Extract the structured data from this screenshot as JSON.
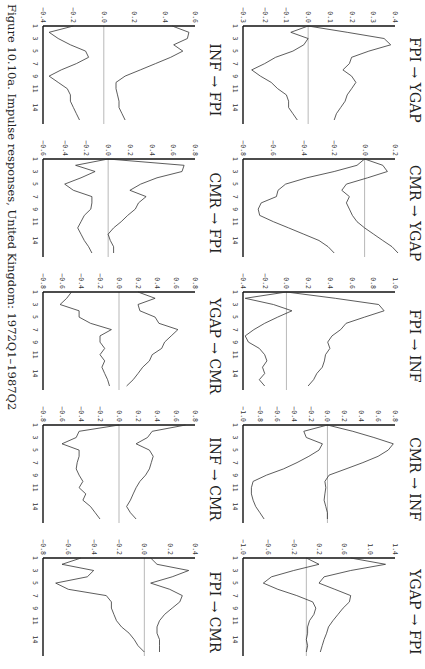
{
  "caption": "Figure 10.10a. Impulse responses, United Kingdom: 1972Q1–1987Q2",
  "chart_data": [
    {
      "type": "line",
      "title": "FPI → YGAP",
      "ylim": [
        -0.3,
        0.4
      ],
      "yticks": [
        0.4,
        0.3,
        0.2,
        0.1,
        0.0,
        -0.1,
        -0.2,
        -0.3
      ],
      "xticks": [
        1,
        3,
        5,
        7,
        9,
        11,
        14
      ],
      "x": [
        1,
        2,
        3,
        4,
        5,
        6,
        7,
        8,
        9,
        10,
        11,
        12,
        13,
        14,
        15,
        16
      ],
      "series": [
        {
          "name": "upper",
          "values": [
            0.0,
            0.18,
            0.35,
            0.38,
            0.28,
            0.2,
            0.19,
            0.16,
            0.2,
            0.22,
            0.2,
            0.18,
            0.17,
            0.15,
            0.13,
            0.12
          ]
        },
        {
          "name": "lower",
          "values": [
            0.0,
            -0.08,
            0.0,
            -0.02,
            -0.07,
            -0.15,
            -0.2,
            -0.26,
            -0.22,
            -0.17,
            -0.14,
            -0.1,
            -0.09,
            -0.09,
            -0.07,
            -0.05
          ]
        }
      ]
    },
    {
      "type": "line",
      "title": "CMR → YGAP",
      "ylim": [
        -0.8,
        0.2
      ],
      "yticks": [
        0.2,
        0.0,
        -0.2,
        -0.4,
        -0.6,
        -0.8
      ],
      "xticks": [
        1,
        3,
        5,
        7,
        9,
        11,
        14
      ],
      "x": [
        1,
        2,
        3,
        4,
        5,
        6,
        7,
        8,
        9,
        10,
        11,
        12,
        13,
        14,
        15,
        16
      ],
      "series": [
        {
          "name": "upper",
          "values": [
            0.0,
            0.12,
            0.15,
            0.02,
            -0.12,
            -0.15,
            -0.1,
            -0.12,
            -0.1,
            -0.08,
            -0.05,
            0.0,
            0.06,
            0.12,
            0.18,
            0.22
          ]
        },
        {
          "name": "lower",
          "values": [
            0.0,
            -0.05,
            -0.2,
            -0.38,
            -0.52,
            -0.57,
            -0.58,
            -0.68,
            -0.7,
            -0.69,
            -0.6,
            -0.5,
            -0.4,
            -0.3,
            -0.24,
            -0.2
          ]
        }
      ]
    },
    {
      "type": "line",
      "title": "FPI → INF",
      "ylim": [
        -0.4,
        1.0
      ],
      "yticks": [
        1.0,
        0.8,
        0.6,
        0.4,
        0.2,
        0.0,
        -0.2,
        -0.4
      ],
      "xticks": [
        1,
        3,
        5,
        7,
        9,
        11,
        14
      ],
      "x": [
        1,
        2,
        3,
        4,
        5,
        6,
        7,
        8,
        9,
        10,
        11,
        12,
        13,
        14,
        15,
        16
      ],
      "series": [
        {
          "name": "upper",
          "values": [
            0.0,
            0.45,
            0.85,
            0.9,
            0.72,
            0.55,
            0.5,
            0.42,
            0.38,
            0.4,
            0.36,
            0.35,
            0.33,
            0.28,
            0.25,
            0.2
          ]
        },
        {
          "name": "lower",
          "values": [
            0.0,
            -0.38,
            -0.12,
            0.05,
            -0.08,
            -0.2,
            -0.3,
            -0.38,
            -0.35,
            -0.25,
            -0.2,
            -0.18,
            -0.22,
            -0.2,
            -0.25,
            -0.2
          ]
        }
      ]
    },
    {
      "type": "line",
      "title": "CMR → INF",
      "ylim": [
        -1.0,
        0.8
      ],
      "yticks": [
        0.8,
        0.6,
        0.4,
        0.2,
        0.0,
        -0.2,
        -0.4,
        -0.6,
        -0.8,
        -1.0
      ],
      "xticks": [
        1,
        3,
        5,
        7,
        9,
        11,
        14
      ],
      "x": [
        1,
        2,
        3,
        4,
        5,
        6,
        7,
        8,
        9,
        10,
        11,
        12,
        13,
        14,
        15,
        16
      ],
      "series": [
        {
          "name": "upper",
          "values": [
            0.0,
            0.3,
            0.55,
            0.78,
            0.72,
            0.6,
            0.42,
            0.22,
            0.02,
            -0.03,
            -0.02,
            -0.03,
            -0.04,
            -0.02,
            0.0,
            0.0
          ]
        },
        {
          "name": "lower",
          "values": [
            0.0,
            -0.28,
            -0.25,
            -0.06,
            -0.1,
            -0.22,
            -0.36,
            -0.52,
            -0.72,
            -0.88,
            -0.9,
            -0.9,
            -0.88,
            -0.85,
            -0.8,
            -0.75
          ]
        }
      ]
    },
    {
      "type": "line",
      "title": "YGAP → FPI",
      "ylim": [
        -1.0,
        1.4
      ],
      "yticks": [
        1.4,
        1.0,
        0.6,
        0.2,
        -0.2,
        -0.6,
        -1.0
      ],
      "xticks": [
        1,
        3,
        5,
        7,
        9,
        11,
        14
      ],
      "x": [
        1,
        2,
        3,
        4,
        5,
        6,
        7,
        8,
        9,
        10,
        11,
        12,
        13,
        14,
        15,
        16
      ],
      "series": [
        {
          "name": "upper",
          "values": [
            0.7,
            1.25,
            0.7,
            0.28,
            0.2,
            0.45,
            0.7,
            0.68,
            0.58,
            0.5,
            0.42,
            0.35,
            0.32,
            0.28,
            0.25,
            0.22
          ]
        },
        {
          "name": "lower",
          "values": [
            0.0,
            0.2,
            -0.2,
            -0.55,
            -0.68,
            -0.45,
            -0.15,
            0.1,
            0.15,
            0.12,
            0.05,
            0.02,
            0.02,
            0.0,
            0.02,
            0.0
          ]
        }
      ]
    },
    {
      "type": "line",
      "title": "INF → FPI",
      "ylim": [
        -0.4,
        0.6
      ],
      "yticks": [
        0.6,
        0.4,
        0.2,
        0.0,
        -0.2,
        -0.4
      ],
      "xticks": [
        1,
        3,
        5,
        7,
        9,
        11,
        14
      ],
      "x": [
        1,
        2,
        3,
        4,
        5,
        6,
        7,
        8,
        9,
        10,
        11,
        12,
        13,
        14,
        15,
        16
      ],
      "series": [
        {
          "name": "upper",
          "values": [
            0.45,
            0.56,
            0.55,
            0.46,
            0.52,
            0.44,
            0.34,
            0.24,
            0.14,
            0.08,
            0.08,
            0.09,
            0.1,
            0.1,
            0.12,
            0.14
          ]
        },
        {
          "name": "lower",
          "values": [
            -0.2,
            -0.36,
            -0.3,
            -0.22,
            -0.12,
            -0.1,
            -0.18,
            -0.28,
            -0.36,
            -0.3,
            -0.24,
            -0.22,
            -0.22,
            -0.2,
            -0.18,
            -0.16
          ]
        }
      ]
    },
    {
      "type": "line",
      "title": "CMR → FPI",
      "ylim": [
        -0.6,
        0.8
      ],
      "yticks": [
        0.8,
        0.6,
        0.4,
        0.2,
        0.0,
        -0.2,
        -0.4,
        -0.6
      ],
      "xticks": [
        1,
        3,
        5,
        7,
        9,
        11,
        14
      ],
      "x": [
        1,
        2,
        3,
        4,
        5,
        6,
        7,
        8,
        9,
        10,
        11,
        12,
        13,
        14,
        15,
        16
      ],
      "series": [
        {
          "name": "upper",
          "values": [
            0.0,
            0.7,
            0.68,
            0.45,
            0.3,
            0.2,
            0.35,
            0.28,
            0.25,
            0.18,
            0.12,
            0.05,
            0.0,
            0.02,
            0.05,
            0.05
          ]
        },
        {
          "name": "lower",
          "values": [
            0.0,
            -0.3,
            -0.12,
            -0.25,
            -0.4,
            -0.32,
            -0.15,
            -0.15,
            -0.16,
            -0.22,
            -0.25,
            -0.28,
            -0.25,
            -0.22,
            -0.18,
            -0.15
          ]
        }
      ]
    },
    {
      "type": "line",
      "title": "YGAP → CMR",
      "ylim": [
        -0.8,
        0.8
      ],
      "yticks": [
        0.8,
        0.6,
        0.4,
        0.2,
        0.0,
        -0.2,
        -0.4,
        -0.6,
        -0.8
      ],
      "xticks": [
        1,
        3,
        5,
        7,
        9,
        11,
        14
      ],
      "x": [
        1,
        2,
        3,
        4,
        5,
        6,
        7,
        8,
        9,
        10,
        11,
        12,
        13,
        14,
        15,
        16
      ],
      "series": [
        {
          "name": "upper",
          "values": [
            0.2,
            0.38,
            0.2,
            0.22,
            0.38,
            0.42,
            0.62,
            0.55,
            0.48,
            0.45,
            0.35,
            0.32,
            0.25,
            0.2,
            0.15,
            0.08
          ]
        },
        {
          "name": "lower",
          "values": [
            -0.5,
            -0.55,
            -0.62,
            -0.42,
            -0.42,
            -0.3,
            -0.08,
            -0.2,
            -0.2,
            -0.15,
            -0.2,
            -0.15,
            -0.18,
            -0.15,
            -0.12,
            -0.1
          ]
        }
      ]
    },
    {
      "type": "line",
      "title": "INF → CMR",
      "ylim": [
        -0.8,
        0.8
      ],
      "yticks": [
        0.8,
        0.6,
        0.4,
        0.2,
        0.0,
        -0.2,
        -0.4,
        -0.6,
        -0.8
      ],
      "xticks": [
        1,
        3,
        5,
        7,
        9,
        11,
        14
      ],
      "x": [
        1,
        2,
        3,
        4,
        5,
        6,
        7,
        8,
        9,
        10,
        11,
        12,
        13,
        14,
        15,
        16
      ],
      "series": [
        {
          "name": "upper",
          "values": [
            0.7,
            0.35,
            0.3,
            0.18,
            0.32,
            0.36,
            0.34,
            0.32,
            0.28,
            0.22,
            0.18,
            0.15,
            0.12,
            0.08,
            0.12,
            0.18
          ]
        },
        {
          "name": "lower",
          "values": [
            0.0,
            -0.42,
            -0.45,
            -0.6,
            -0.42,
            -0.42,
            -0.44,
            -0.45,
            -0.42,
            -0.38,
            -0.42,
            -0.35,
            -0.38,
            -0.3,
            -0.25,
            -0.2
          ]
        }
      ]
    },
    {
      "type": "line",
      "title": "FPI → CMR",
      "ylim": [
        -0.8,
        0.4
      ],
      "yticks": [
        0.4,
        0.2,
        0.0,
        -0.2,
        -0.4,
        -0.6,
        -0.8
      ],
      "xticks": [
        1,
        3,
        5,
        7,
        9,
        11,
        14
      ],
      "x": [
        1,
        2,
        3,
        4,
        5,
        6,
        7,
        8,
        9,
        10,
        11,
        12,
        13,
        14,
        15,
        16
      ],
      "series": [
        {
          "name": "upper",
          "values": [
            0.05,
            0.1,
            0.35,
            0.22,
            0.05,
            0.2,
            0.3,
            0.28,
            0.22,
            0.16,
            0.12,
            0.1,
            0.1,
            0.12,
            0.12,
            0.12
          ]
        },
        {
          "name": "lower",
          "values": [
            -0.5,
            -0.65,
            -0.4,
            -0.45,
            -0.7,
            -0.6,
            -0.3,
            -0.26,
            -0.26,
            -0.24,
            -0.22,
            -0.18,
            -0.12,
            -0.08,
            -0.05,
            0.0
          ]
        }
      ]
    }
  ]
}
